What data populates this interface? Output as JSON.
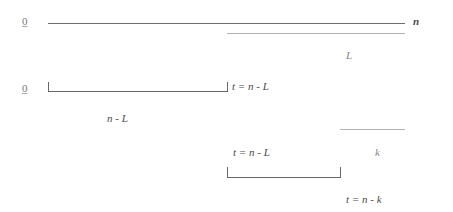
{
  "diagram": {
    "row1": {
      "start_label": "0",
      "end_label": "n",
      "segment_label": "L"
    },
    "row2": {
      "start_label": "0",
      "end_label": "t = n - L",
      "length_label": "n - L"
    },
    "row3": {
      "segment_label": "k",
      "start_label": "t = n - L",
      "end_label": "t = n - k"
    }
  }
}
